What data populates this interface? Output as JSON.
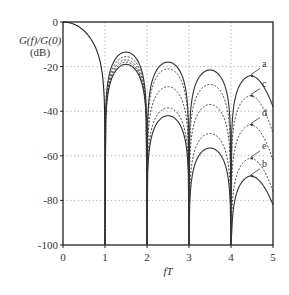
{
  "chart_data": {
    "type": "line",
    "title": "",
    "xlabel": "fT",
    "ylabel": "G(f)/G(0) (dB)",
    "ylabel_lines": [
      "G(f)/G(0)",
      "(dB)"
    ],
    "xlim": [
      0,
      5
    ],
    "ylim": [
      -100,
      0
    ],
    "x_ticks": [
      0,
      1,
      2,
      3,
      4,
      5
    ],
    "y_ticks": [
      0,
      -20,
      -40,
      -60,
      -80,
      -100
    ],
    "grid": true,
    "grid_style": "dotted",
    "legend": "inline annotations with arrows (a, b, c, d, e)",
    "main_lobe": {
      "description": "shared main lobe from 0 dB at fT=0 to null at fT=1",
      "x": [
        0,
        0.2,
        0.4,
        0.6,
        0.8,
        0.9,
        1.0
      ],
      "y": [
        0,
        -0.6,
        -2.5,
        -6,
        -14,
        -20,
        -100
      ]
    },
    "nulls_at": [
      1,
      2,
      3,
      4
    ],
    "series": [
      {
        "name": "a",
        "style": "solid",
        "sidelobe_peaks": [
          {
            "x": 1.45,
            "y": -13.5
          },
          {
            "x": 2.45,
            "y": -18
          },
          {
            "x": 3.45,
            "y": -21.5
          },
          {
            "x": 4.45,
            "y": -24
          }
        ],
        "end_value_at_5": -38
      },
      {
        "name": "c",
        "style": "dashed",
        "sidelobe_peaks": [
          {
            "x": 1.45,
            "y": -15.5
          },
          {
            "x": 2.45,
            "y": -21
          },
          {
            "x": 3.45,
            "y": -28
          },
          {
            "x": 4.45,
            "y": -33
          }
        ],
        "end_value_at_5": -50
      },
      {
        "name": "d",
        "style": "dashed",
        "sidelobe_peaks": [
          {
            "x": 1.45,
            "y": -17
          },
          {
            "x": 2.45,
            "y": -29
          },
          {
            "x": 3.45,
            "y": -37
          },
          {
            "x": 4.45,
            "y": -46
          }
        ],
        "end_value_at_5": -62
      },
      {
        "name": "e",
        "style": "dashed",
        "sidelobe_peaks": [
          {
            "x": 1.45,
            "y": -18
          },
          {
            "x": 2.45,
            "y": -38.5
          },
          {
            "x": 3.45,
            "y": -50
          },
          {
            "x": 4.45,
            "y": -61
          }
        ],
        "end_value_at_5": -76
      },
      {
        "name": "b",
        "style": "solid",
        "sidelobe_peaks": [
          {
            "x": 1.45,
            "y": -19
          },
          {
            "x": 2.45,
            "y": -42
          },
          {
            "x": 3.45,
            "y": -56.5
          },
          {
            "x": 4.45,
            "y": -69
          }
        ],
        "end_value_at_5": -82
      }
    ],
    "annotations": [
      {
        "label": "a",
        "arrow_to": {
          "x": 4.45,
          "y": -24
        }
      },
      {
        "label": "c",
        "arrow_to": {
          "x": 4.45,
          "y": -33
        }
      },
      {
        "label": "d",
        "arrow_to": {
          "x": 4.45,
          "y": -46
        }
      },
      {
        "label": "e",
        "arrow_to": {
          "x": 4.45,
          "y": -61
        }
      },
      {
        "label": "b",
        "arrow_to": {
          "x": 4.45,
          "y": -69
        }
      }
    ]
  }
}
